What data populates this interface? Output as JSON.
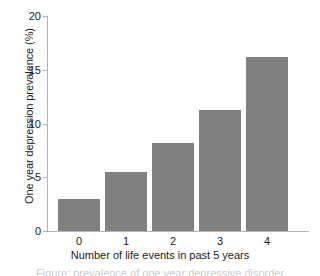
{
  "chart_data": {
    "type": "bar",
    "title": "",
    "xlabel": "Number of life events in past 5 years",
    "ylabel": "One year depression prevalence (%)",
    "categories": [
      "0",
      "1",
      "2",
      "3",
      "4"
    ],
    "values": [
      3.0,
      5.5,
      8.2,
      11.3,
      16.2
    ],
    "ylim": [
      0,
      20
    ],
    "yticks": [
      "0",
      "5",
      "10",
      "15",
      "20"
    ],
    "ytick_values": [
      0,
      5,
      10,
      15,
      20
    ],
    "grid": false,
    "legend": false,
    "legend_position": "none",
    "bar_color": "#808080",
    "axis_color": "#b3b3b3",
    "text_color": "#222222"
  },
  "caption": {
    "partial_text": "Figure: prevalence of one year depressive disorder"
  }
}
